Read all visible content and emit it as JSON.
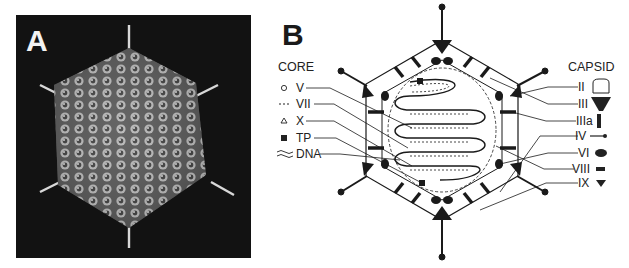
{
  "figure": {
    "panel_a": {
      "label": "A",
      "description": "Cryo-EM surface rendering of adenovirus icosahedral capsid with protruding fibers",
      "background_color": "#121212"
    },
    "panel_b": {
      "label": "B",
      "description": "Schematic cross-section of adenovirus virion",
      "core": {
        "title": "CORE",
        "items": [
          {
            "symbol": "circle-icon",
            "label": "V"
          },
          {
            "symbol": "dashed-line-icon",
            "label": "VII"
          },
          {
            "symbol": "triangle-outline-icon",
            "label": "X"
          },
          {
            "symbol": "filled-square-icon",
            "label": "TP"
          },
          {
            "symbol": "double-wave-icon",
            "label": "DNA"
          }
        ]
      },
      "capsid": {
        "title": "CAPSID",
        "items": [
          {
            "symbol": "hexon-outline-icon",
            "label": "II"
          },
          {
            "symbol": "penton-base-icon",
            "label": "III"
          },
          {
            "symbol": "bar-icon",
            "label": "IIIa"
          },
          {
            "symbol": "fiber-icon",
            "label": "IV"
          },
          {
            "symbol": "oval-icon",
            "label": "VI"
          },
          {
            "symbol": "small-rect-icon",
            "label": "VIII"
          },
          {
            "symbol": "small-triangle-icon",
            "label": "IX"
          }
        ]
      }
    }
  }
}
